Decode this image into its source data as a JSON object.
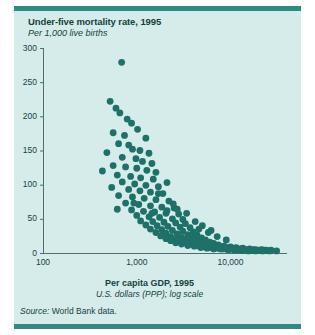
{
  "figure": {
    "title": "Under-five mortality rate, 1995",
    "subtitle": "Per 1,000 live births",
    "xtitle": "Per capita GDP, 1995",
    "xunits": "U.S. dollars (PPP); log scale",
    "source_label": "Source:",
    "source_text": " World Bank data."
  },
  "colors": {
    "panel_background": "#d5ecea",
    "rule": "#2e8b84",
    "point": "#1f7068",
    "axis": "#4e6f6d",
    "text": "#16423f"
  },
  "chart_data": {
    "type": "scatter",
    "title": "Under-five mortality rate, 1995",
    "subtitle": "Per 1,000 live births",
    "xlabel": "Per capita GDP, 1995",
    "xlabel_units": "U.S. dollars (PPP); log scale",
    "ylabel": "Per 1,000 live births",
    "xscale": "log",
    "yscale": "linear",
    "xlim": [
      100,
      40000
    ],
    "ylim": [
      0,
      300
    ],
    "xticks": [
      100,
      1000,
      10000
    ],
    "xticklabels": [
      "100",
      "1,000",
      "10,000"
    ],
    "yticks": [
      0,
      50,
      100,
      150,
      200,
      250,
      300
    ],
    "yticklabels": [
      "0",
      "50",
      "100",
      "150",
      "200",
      "250",
      "300"
    ],
    "grid": false,
    "legend": null,
    "marker": "circle",
    "marker_color": "#1f7068",
    "marker_size": 3.4,
    "series": [
      {
        "name": "Countries",
        "points": [
          [
            690,
            279
          ],
          [
            520,
            222
          ],
          [
            600,
            212
          ],
          [
            660,
            205
          ],
          [
            790,
            196
          ],
          [
            880,
            190
          ],
          [
            560,
            176
          ],
          [
            740,
            172
          ],
          [
            1020,
            181
          ],
          [
            1250,
            168
          ],
          [
            640,
            160
          ],
          [
            820,
            158
          ],
          [
            900,
            152
          ],
          [
            1080,
            150
          ],
          [
            1350,
            146
          ],
          [
            480,
            147
          ],
          [
            700,
            140
          ],
          [
            980,
            138
          ],
          [
            1150,
            134
          ],
          [
            1450,
            131
          ],
          [
            560,
            128
          ],
          [
            760,
            126
          ],
          [
            1000,
            124
          ],
          [
            1280,
            121
          ],
          [
            1600,
            118
          ],
          [
            430,
            120
          ],
          [
            620,
            114
          ],
          [
            860,
            112
          ],
          [
            1100,
            110
          ],
          [
            1500,
            108
          ],
          [
            700,
            104
          ],
          [
            950,
            101
          ],
          [
            1250,
            99
          ],
          [
            1700,
            97
          ],
          [
            2100,
            103
          ],
          [
            540,
            96
          ],
          [
            820,
            93
          ],
          [
            1080,
            91
          ],
          [
            1400,
            89
          ],
          [
            1900,
            87
          ],
          [
            640,
            84
          ],
          [
            900,
            82
          ],
          [
            1200,
            80
          ],
          [
            1600,
            78
          ],
          [
            2200,
            76
          ],
          [
            760,
            73
          ],
          [
            1050,
            71
          ],
          [
            1400,
            69
          ],
          [
            1850,
            67
          ],
          [
            2500,
            66
          ],
          [
            880,
            63
          ],
          [
            1180,
            61
          ],
          [
            1550,
            60
          ],
          [
            2050,
            58
          ],
          [
            2800,
            57
          ],
          [
            620,
            64
          ],
          [
            1000,
            55
          ],
          [
            1350,
            53
          ],
          [
            1750,
            52
          ],
          [
            2400,
            50
          ],
          [
            1100,
            47
          ],
          [
            1480,
            46
          ],
          [
            1950,
            45
          ],
          [
            2600,
            44
          ],
          [
            3300,
            43
          ],
          [
            1250,
            41
          ],
          [
            1650,
            40
          ],
          [
            2150,
            39
          ],
          [
            2900,
            38
          ],
          [
            3700,
            37
          ],
          [
            1400,
            35
          ],
          [
            1850,
            34
          ],
          [
            2400,
            33
          ],
          [
            3100,
            32
          ],
          [
            4000,
            31
          ],
          [
            1600,
            30
          ],
          [
            2050,
            29
          ],
          [
            2700,
            28
          ],
          [
            3500,
            27
          ],
          [
            4400,
            26
          ],
          [
            1800,
            25
          ],
          [
            2300,
            24
          ],
          [
            3000,
            23
          ],
          [
            3900,
            22
          ],
          [
            4900,
            22
          ],
          [
            2050,
            21
          ],
          [
            2600,
            21
          ],
          [
            3300,
            20
          ],
          [
            4200,
            20
          ],
          [
            5400,
            19
          ],
          [
            2300,
            18
          ],
          [
            2900,
            18
          ],
          [
            3700,
            17
          ],
          [
            4700,
            17
          ],
          [
            6000,
            16
          ],
          [
            2600,
            15
          ],
          [
            3300,
            15
          ],
          [
            4100,
            14
          ],
          [
            5200,
            14
          ],
          [
            6600,
            14
          ],
          [
            3000,
            13
          ],
          [
            3800,
            13
          ],
          [
            4700,
            12
          ],
          [
            5900,
            12
          ],
          [
            7400,
            12
          ],
          [
            3500,
            11
          ],
          [
            4400,
            11
          ],
          [
            5500,
            11
          ],
          [
            6900,
            10
          ],
          [
            8500,
            10
          ],
          [
            4100,
            10
          ],
          [
            5100,
            9
          ],
          [
            6400,
            9
          ],
          [
            8000,
            9
          ],
          [
            10000,
            9
          ],
          [
            4800,
            8
          ],
          [
            6000,
            8
          ],
          [
            7500,
            8
          ],
          [
            9400,
            8
          ],
          [
            11500,
            8
          ],
          [
            5600,
            7
          ],
          [
            7000,
            7
          ],
          [
            8800,
            7
          ],
          [
            11000,
            7
          ],
          [
            13500,
            7
          ],
          [
            6600,
            6
          ],
          [
            8200,
            6
          ],
          [
            10300,
            6
          ],
          [
            12800,
            6
          ],
          [
            16000,
            6
          ],
          [
            7800,
            6
          ],
          [
            9700,
            5
          ],
          [
            12100,
            5
          ],
          [
            15000,
            5
          ],
          [
            18500,
            5
          ],
          [
            9200,
            5
          ],
          [
            11400,
            5
          ],
          [
            14200,
            5
          ],
          [
            17600,
            5
          ],
          [
            21500,
            5
          ],
          [
            11000,
            4
          ],
          [
            13600,
            4
          ],
          [
            17000,
            4
          ],
          [
            20500,
            4
          ],
          [
            24000,
            4
          ],
          [
            13000,
            4
          ],
          [
            16000,
            4
          ],
          [
            19500,
            4
          ],
          [
            23000,
            4
          ],
          [
            27000,
            4
          ],
          [
            15500,
            3
          ],
          [
            18500,
            3
          ],
          [
            22000,
            3
          ],
          [
            26000,
            3
          ],
          [
            31000,
            3
          ],
          [
            2100,
            62
          ],
          [
            3100,
            49
          ],
          [
            4600,
            35
          ],
          [
            1450,
            58
          ],
          [
            930,
            73
          ],
          [
            1700,
            87
          ],
          [
            2700,
            64
          ],
          [
            5800,
            30
          ],
          [
            7200,
            24
          ],
          [
            9000,
            19
          ],
          [
            3400,
            58
          ],
          [
            4200,
            46
          ],
          [
            5000,
            40
          ],
          [
            6200,
            33
          ],
          [
            2450,
            72
          ]
        ]
      }
    ]
  }
}
